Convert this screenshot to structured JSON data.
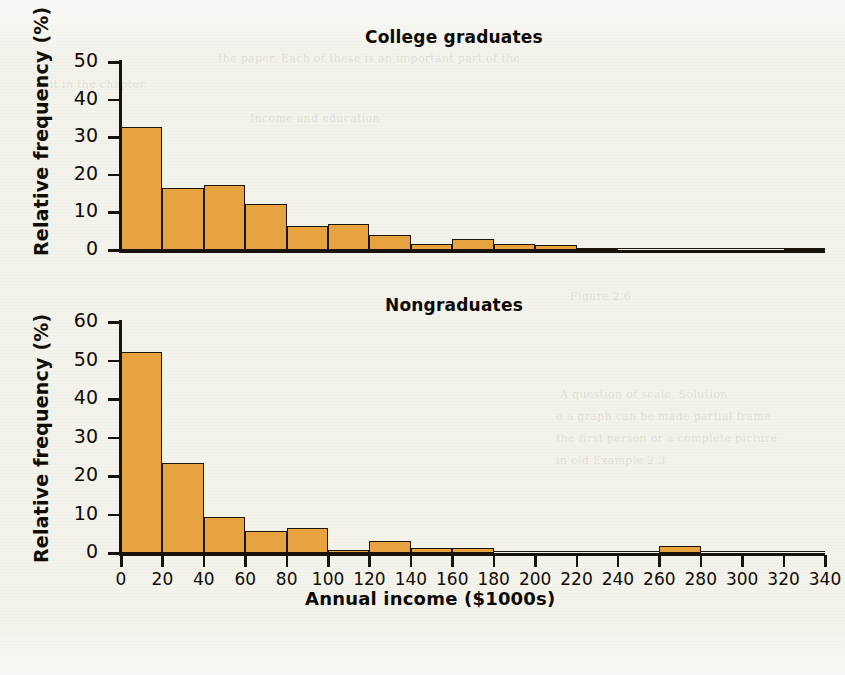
{
  "page": {
    "background_color": "#f3f2eb",
    "bar_fill_color": "#e7a340",
    "bar_stroke_color": "#1b1509",
    "axis_color": "#17120c",
    "text_color": "#100c06"
  },
  "ghost_text": [
    "the paper. Each of these is an important part of the",
    "s it in the chapter.",
    "Income and education",
    "Figure 2.6",
    "A question of scale. Solution",
    "o a graph can be made partial frame",
    "the first person or a complete picture",
    "in old Example 2.3"
  ],
  "xaxis": {
    "label": "Annual income ($1000s)",
    "ticks": [
      0,
      20,
      40,
      60,
      80,
      100,
      120,
      140,
      160,
      180,
      200,
      220,
      240,
      260,
      280,
      300,
      320,
      340
    ],
    "min": 0,
    "max": 340,
    "bin_width": 20
  },
  "charts": [
    {
      "id": "college-graduates",
      "title": "College graduates",
      "ylabel": "Relative frequency (%)",
      "yticks": [
        0,
        10,
        20,
        30,
        40,
        50
      ],
      "ymin": 0,
      "ymax": 50
    },
    {
      "id": "nongraduates",
      "title": "Nongraduates",
      "ylabel": "Relative frequency (%)",
      "yticks": [
        0,
        10,
        20,
        30,
        40,
        50,
        60
      ],
      "ymin": 0,
      "ymax": 60
    }
  ],
  "chart_data": [
    {
      "type": "bar",
      "id": "college-graduates",
      "title": "College graduates",
      "xlabel": "Annual income ($1000s)",
      "ylabel": "Relative frequency (%)",
      "xlim": [
        0,
        340
      ],
      "ylim": [
        0,
        50
      ],
      "yticks": [
        0,
        10,
        20,
        30,
        40,
        50
      ],
      "xticks": [
        0,
        20,
        40,
        60,
        80,
        100,
        120,
        140,
        160,
        180,
        200,
        220,
        240,
        260,
        280,
        300,
        320,
        340
      ],
      "bin_width": 20,
      "grid": false,
      "legend": "none",
      "bin_starts": [
        0,
        20,
        40,
        60,
        80,
        100,
        120,
        140,
        160,
        180,
        200,
        220,
        240,
        260,
        280,
        300,
        320
      ],
      "bin_labels": [
        "0-20",
        "20-40",
        "40-60",
        "60-80",
        "80-100",
        "100-120",
        "120-140",
        "140-160",
        "160-180",
        "180-200",
        "200-220",
        "220-240",
        "240-260",
        "260-280",
        "280-300",
        "300-320",
        "320-340"
      ],
      "values": [
        32.7,
        16.5,
        17.2,
        12.3,
        6.5,
        6.8,
        4.0,
        1.7,
        2.8,
        1.6,
        1.2,
        0.6,
        0.4,
        0.3,
        0.2,
        0.1,
        0.6
      ]
    },
    {
      "type": "bar",
      "id": "nongraduates",
      "title": "Nongraduates",
      "xlabel": "Annual income ($1000s)",
      "ylabel": "Relative frequency (%)",
      "xlim": [
        0,
        340
      ],
      "ylim": [
        0,
        60
      ],
      "yticks": [
        0,
        10,
        20,
        30,
        40,
        50,
        60
      ],
      "xticks": [
        0,
        20,
        40,
        60,
        80,
        100,
        120,
        140,
        160,
        180,
        200,
        220,
        240,
        260,
        280,
        300,
        320,
        340
      ],
      "bin_width": 20,
      "grid": false,
      "legend": "none",
      "bin_starts": [
        0,
        20,
        40,
        60,
        80,
        100,
        120,
        140,
        160,
        180,
        200,
        220,
        240,
        260,
        280,
        300,
        320
      ],
      "bin_labels": [
        "0-20",
        "20-40",
        "40-60",
        "60-80",
        "80-100",
        "100-120",
        "120-140",
        "140-160",
        "160-180",
        "180-200",
        "200-220",
        "220-240",
        "240-260",
        "260-280",
        "280-300",
        "300-320",
        "320-340"
      ],
      "values": [
        52.2,
        23.5,
        9.3,
        5.8,
        6.4,
        0.8,
        3.2,
        1.3,
        1.3,
        0.0,
        0.0,
        0.0,
        0.0,
        1.8,
        0.0,
        0.0,
        0.0
      ]
    }
  ]
}
